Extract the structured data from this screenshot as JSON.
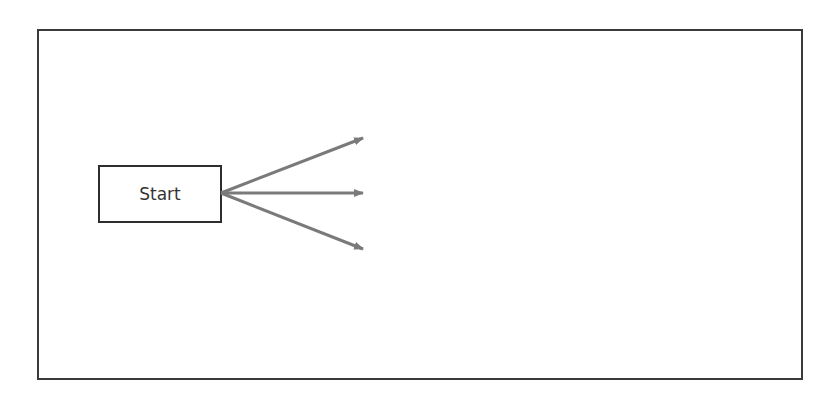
{
  "diagram": {
    "nodes": [
      {
        "id": "start",
        "label": "Start"
      }
    ],
    "edges": [
      {
        "from": "start",
        "direction": "up-right"
      },
      {
        "from": "start",
        "direction": "right"
      },
      {
        "from": "start",
        "direction": "down-right"
      }
    ],
    "colors": {
      "frame_border": "#3a3a3a",
      "node_border": "#2e2e2e",
      "arrow": "#7a7a7a",
      "text": "#333333"
    }
  }
}
